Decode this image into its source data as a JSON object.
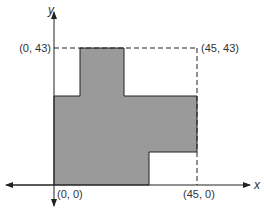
{
  "diagram": {
    "axes": {
      "x_label": "x",
      "y_label": "y"
    },
    "points": [
      {
        "label": "(0, 43)"
      },
      {
        "label": "(45, 43)"
      },
      {
        "label": "(0, 0)"
      },
      {
        "label": "(45, 0)"
      }
    ],
    "fill_color": "#9a9a9a",
    "line_color": "#222222"
  }
}
